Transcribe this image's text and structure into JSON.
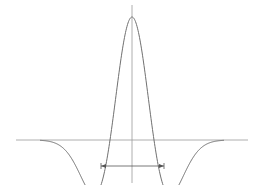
{
  "diagram": {
    "type": "ricker-wavelet",
    "colors": {
      "background": "#ffffff",
      "axis": "#9a9a9a",
      "curve": "#707070",
      "marker": "#555555"
    },
    "axes": {
      "horizontal": {
        "x1": 16,
        "x2": 248,
        "y": 140
      },
      "vertical": {
        "x": 132,
        "y1": 5,
        "y2": 183
      }
    },
    "curve": {
      "center_x": 132,
      "baseline_y": 140,
      "peak_y": 17,
      "sigma_px": 22
    },
    "width_marker": {
      "x1": 101,
      "x2": 164,
      "y": 166
    }
  }
}
